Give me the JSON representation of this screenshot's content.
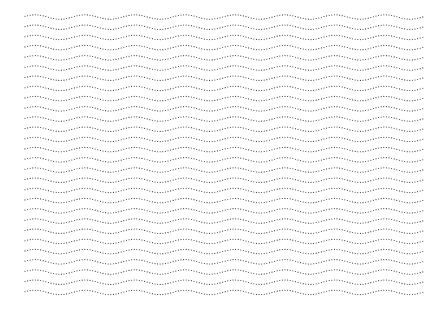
{
  "pattern": {
    "type": "dotted-wave-lines",
    "x_start": 25,
    "x_end": 423,
    "y_start": 17,
    "row_count": 28,
    "row_spacing": 10.2,
    "wavelength": 50,
    "amplitude": 2.2,
    "phase_offset": 10,
    "dot_spacing": 2.6,
    "dot_radius": 0.55,
    "dot_color": "#333333",
    "background": "#ffffff"
  }
}
